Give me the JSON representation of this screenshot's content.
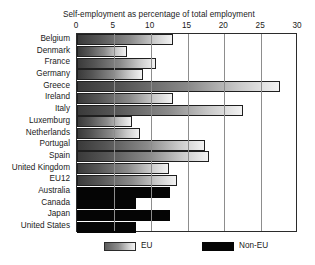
{
  "chart_data": {
    "type": "bar",
    "orientation": "horizontal",
    "title": "Self-employment as percentage of total employment",
    "xlabel": "",
    "ylabel": "",
    "xlim": [
      0,
      30
    ],
    "xticks": [
      0,
      5,
      10,
      15,
      20,
      25,
      30
    ],
    "xtick_labels": [
      "0",
      "5",
      "10",
      "15",
      "20",
      "25",
      "30"
    ],
    "grid": true,
    "grid_axis": "x",
    "legend_position": "bottom",
    "categories": [
      "Belgium",
      "Denmark",
      "France",
      "Germany",
      "Greece",
      "Ireland",
      "Italy",
      "Luxemburg",
      "Netherlands",
      "Portugal",
      "Spain",
      "United Kingdom",
      "EU12",
      "Australia",
      "Canada",
      "Japan",
      "United States"
    ],
    "values": [
      13.0,
      6.8,
      10.7,
      8.9,
      27.5,
      13.0,
      22.6,
      7.5,
      8.5,
      17.4,
      17.9,
      12.5,
      13.6,
      12.6,
      8.0,
      12.6,
      8.0
    ],
    "groups": [
      "EU",
      "EU",
      "EU",
      "EU",
      "EU",
      "EU",
      "EU",
      "EU",
      "EU",
      "EU",
      "EU",
      "EU",
      "EU",
      "Non-EU",
      "Non-EU",
      "Non-EU",
      "Non-EU"
    ],
    "legend": [
      {
        "label": "EU",
        "style": "gradient-grey"
      },
      {
        "label": "Non-EU",
        "style": "solid-black"
      }
    ],
    "colors": {
      "eu_gradient_start": "#3a3a3a",
      "eu_gradient_end": "#f2f2f2",
      "non_eu": "#050505",
      "axis": "#2b2b2b",
      "gridline": "#8d8d8d",
      "background": "#ffffff",
      "text": "#1a1a1a"
    }
  }
}
